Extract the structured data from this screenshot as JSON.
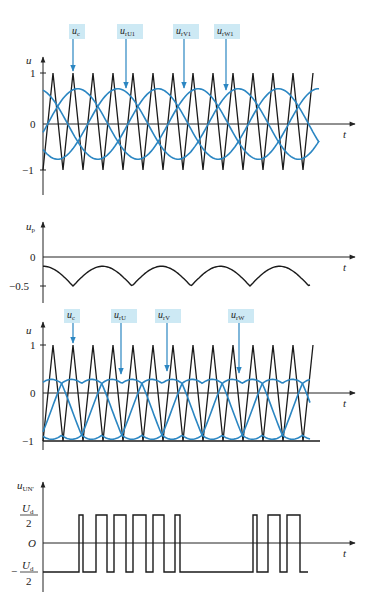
{
  "colors": {
    "carrier": "#1a1a1a",
    "reference": "#2b86c2",
    "callout_bg": "#cde9f4",
    "callout_arrow": "#2b86c2",
    "axis": "#222222"
  },
  "panels": [
    {
      "id": "panel1",
      "ylabel": "u",
      "xlabel": "t",
      "ticks": [
        {
          "label": "1",
          "value": 1
        },
        {
          "label": "0",
          "value": 0
        },
        {
          "label": "−1",
          "value": -1
        }
      ],
      "callouts": [
        {
          "label": "u",
          "sub": "c",
          "box_x": 69,
          "target_x": 73,
          "target_y": 72
        },
        {
          "label": "u",
          "sub": "rU1",
          "box_x": 117,
          "target_x": 126,
          "target_y": 89
        },
        {
          "label": "u",
          "sub": "rV1",
          "box_x": 173,
          "target_x": 184,
          "target_y": 89
        },
        {
          "label": "u",
          "sub": "rW1",
          "box_x": 214,
          "target_x": 226,
          "target_y": 91
        }
      ]
    },
    {
      "id": "panel2",
      "ylabel": "u",
      "ylabel_sub": "p",
      "xlabel": "t",
      "ticks": [
        {
          "label": "0",
          "value": 0
        },
        {
          "label": "−0.5",
          "value": -0.5
        }
      ]
    },
    {
      "id": "panel3",
      "ylabel": "u",
      "xlabel": "t",
      "ticks": [
        {
          "label": "1",
          "value": 1
        },
        {
          "label": "0",
          "value": 0
        },
        {
          "label": "−1",
          "value": -1
        }
      ],
      "callouts": [
        {
          "label": "u",
          "sub": "c",
          "box_x": 64,
          "target_x": 73,
          "target_y": 344
        },
        {
          "label": "u",
          "sub": "rU",
          "box_x": 111,
          "target_x": 121,
          "target_y": 375
        },
        {
          "label": "u",
          "sub": "rV",
          "box_x": 155,
          "target_x": 167,
          "target_y": 372
        },
        {
          "label": "u",
          "sub": "rW",
          "box_x": 228,
          "target_x": 239,
          "target_y": 374
        }
      ]
    },
    {
      "id": "panel4",
      "ylabel": "u",
      "ylabel_sub": "UN'",
      "xlabel": "t",
      "ticks": [
        {
          "label_num": "U",
          "label_num_sub": "d",
          "label_den": "2",
          "value": 1
        },
        {
          "label": "O",
          "value": 0
        },
        {
          "label_neg": "−",
          "label_num": "U",
          "label_num_sub": "d",
          "label_den": "2",
          "value": -1
        }
      ]
    }
  ],
  "chart_data": [
    {
      "type": "line",
      "title": "Carrier and fundamental references",
      "xlabel": "t",
      "ylabel": "u",
      "ylim": [
        -1,
        1
      ],
      "series": [
        {
          "name": "u_c (triangular carrier)",
          "shape": "triangle",
          "amplitude": 1,
          "periods": 13.5
        },
        {
          "name": "u_rU1",
          "shape": "sine",
          "amplitude": 0.72,
          "phase_deg": 0
        },
        {
          "name": "u_rV1",
          "shape": "sine",
          "amplitude": 0.72,
          "phase_deg": -120
        },
        {
          "name": "u_rW1",
          "shape": "sine",
          "amplitude": 0.72,
          "phase_deg": 120
        }
      ],
      "fundamental_periods": 2.3
    },
    {
      "type": "line",
      "title": "Zero-sequence injection u_p",
      "xlabel": "t",
      "ylabel": "u_p",
      "ylim": [
        -0.6,
        0.1
      ],
      "yticks": [
        0,
        -0.5
      ],
      "series": [
        {
          "name": "u_p",
          "min": -0.5,
          "max": -0.16,
          "cusps": 5
        }
      ]
    },
    {
      "type": "line",
      "title": "Modified references u_r = u_r1 + u_p",
      "xlabel": "t",
      "ylabel": "u",
      "ylim": [
        -1,
        1
      ],
      "series": [
        {
          "name": "u_c",
          "shape": "triangle",
          "amplitude": 1
        },
        {
          "name": "u_rU"
        },
        {
          "name": "u_rV"
        },
        {
          "name": "u_rW"
        }
      ]
    },
    {
      "type": "line",
      "title": "Phase voltage u_UN'",
      "xlabel": "t",
      "ylabel": "u_UN'",
      "yticks": [
        "Ud/2",
        "O",
        "-Ud/2"
      ],
      "pulses_high_x": [
        [
          79,
          83
        ],
        [
          96,
          107
        ],
        [
          114,
          126
        ],
        [
          133,
          146
        ],
        [
          153,
          164
        ],
        [
          175,
          180
        ],
        [
          253,
          257
        ],
        [
          268,
          280
        ],
        [
          287,
          300
        ]
      ],
      "x_range": [
        43,
        308
      ]
    }
  ]
}
